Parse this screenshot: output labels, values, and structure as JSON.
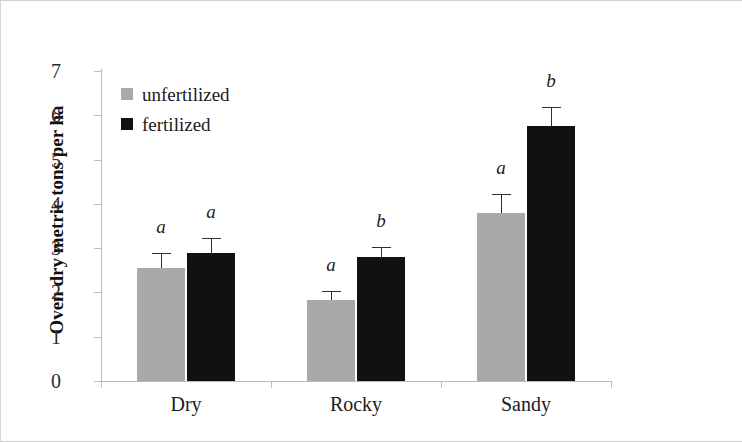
{
  "chart_data": {
    "type": "bar",
    "title": "",
    "xlabel": "",
    "ylabel": "Oven dry metric tons per ha",
    "categories": [
      "Dry",
      "Rocky",
      "Sandy"
    ],
    "ylim": [
      0,
      7
    ],
    "yticks": [
      0,
      1,
      2,
      3,
      4,
      5,
      6,
      7
    ],
    "ytick_labels": [
      "0",
      "1",
      "2",
      "3",
      "4",
      "5",
      "6",
      "7"
    ],
    "grid": false,
    "legend_position": "top-left",
    "series": [
      {
        "name": "unfertilized",
        "color": "#a9a9a9",
        "values": [
          2.55,
          1.83,
          3.8
        ],
        "errors": [
          0.33,
          0.2,
          0.42
        ],
        "sig_letters": [
          "a",
          "a",
          "a"
        ]
      },
      {
        "name": "fertilized",
        "color": "#111111",
        "values": [
          2.9,
          2.8,
          5.75
        ],
        "errors": [
          0.33,
          0.22,
          0.43
        ],
        "sig_letters": [
          "a",
          "b",
          "b"
        ]
      }
    ]
  },
  "legend": {
    "items": [
      {
        "label": "unfertilized",
        "swatch": "gray-square-icon"
      },
      {
        "label": "fertilized",
        "swatch": "black-square-icon"
      }
    ]
  },
  "axes": {
    "y_title": "Oven dry metric tons per ha",
    "y_tick_labels": [
      "7",
      "6",
      "5",
      "4",
      "3",
      "2",
      "1",
      "0"
    ],
    "x_tick_labels": [
      "Dry",
      "Rocky",
      "Sandy"
    ]
  }
}
